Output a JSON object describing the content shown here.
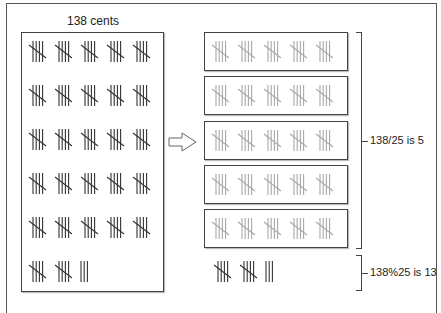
{
  "title": "138 cents",
  "total": 138,
  "group_size": 25,
  "tally_per_group": 5,
  "left_panel": {
    "rows_of_five_groups": 5,
    "remainder_row": {
      "full_groups": 2,
      "extra_marks": 3
    }
  },
  "right_panel": {
    "boxes": 5,
    "groups_per_box": 5,
    "remainder": {
      "full_groups": 2,
      "extra_marks": 3
    }
  },
  "annotations": {
    "quotient": "138/25 is 5",
    "remainder": "138%25 is 13"
  },
  "arrow_icon": "right-hollow-arrow",
  "colors": {
    "dark_tally": "#333333",
    "light_tally": "#a8a8a8"
  }
}
